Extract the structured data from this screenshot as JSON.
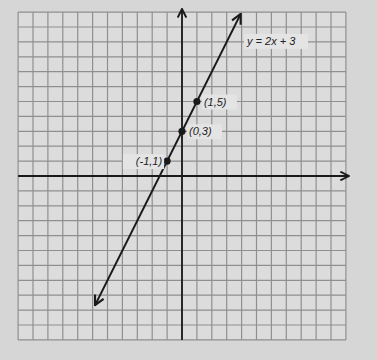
{
  "chart_data": {
    "type": "line",
    "title": "",
    "xlabel": "",
    "ylabel": "",
    "xlim": [
      -11,
      11
    ],
    "ylim": [
      -11,
      11
    ],
    "grid": true,
    "axes_arrows": true,
    "series": [
      {
        "name": "y = 2x + 3",
        "equation": "y = 2x + 3",
        "slope": 2,
        "intercept": 3,
        "x_range": [
          -5.8,
          3.9
        ],
        "arrows_both_ends": true,
        "marked_points": [
          {
            "x": -1,
            "y": 1,
            "label": "(-1,1)"
          },
          {
            "x": 0,
            "y": 3,
            "label": "(0,3)"
          },
          {
            "x": 1,
            "y": 5,
            "label": "(1,5)"
          }
        ]
      }
    ],
    "annotations": [
      {
        "text": "y = 2x + 3",
        "x": 4.5,
        "y": 8.8
      }
    ]
  },
  "colors": {
    "background": "#d6d6d6",
    "grid_fill": "#dcdcdc",
    "grid_line": "#8f8f8f",
    "axis": "#1a1a1a",
    "line": "#1a1a1a",
    "label_bg": "#e4e4e4"
  },
  "labels": {
    "equation": "y = 2x + 3",
    "p1": "(-1,1)",
    "p2": "(0,3)",
    "p3": "(1,5)"
  }
}
